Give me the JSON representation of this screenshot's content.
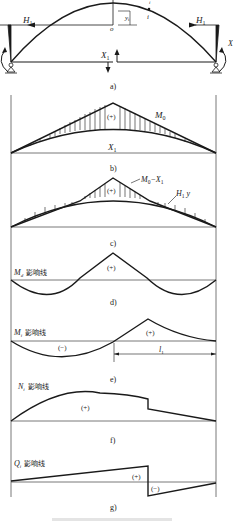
{
  "figure": {
    "panels": {
      "a": {
        "label": "a)",
        "left_force": "H",
        "left_force_sub": "1",
        "right_force": "H",
        "right_force_sub": "1",
        "redundant": "X",
        "redundant_sub": "1",
        "origin": "o",
        "section": "i",
        "section_top": "i",
        "ordinate": "y",
        "ordinate_sub": "i",
        "moment": "X"
      },
      "b": {
        "label": "b)",
        "curve_label": "M",
        "curve_label_sub": "0",
        "arch_label": "X",
        "arch_label_sub": "1",
        "sign": "(+)"
      },
      "c": {
        "label": "c)",
        "diff_label": "M",
        "diff_label_sub": "0",
        "diff_label_rest": "−X",
        "diff_label_rest_sub": "1",
        "arch_label": "H",
        "arch_label_sub": "1",
        "arch_label_var": "y",
        "sign": "(+)"
      },
      "d": {
        "label": "d)",
        "title": "M",
        "title_sub": "d",
        "title_cn": "影响线",
        "sign": "(+)"
      },
      "e": {
        "label": "e)",
        "title": "M",
        "title_sub": "i",
        "title_cn": "影响线",
        "sign_pos": "(+)",
        "sign_neg": "(−)",
        "dimension": "l",
        "dimension_sub": "1"
      },
      "f": {
        "label": "f)",
        "title": "N",
        "title_sub": "i",
        "title_cn": "影响线",
        "sign": "(+)"
      },
      "g": {
        "label": "g)",
        "title": "Q",
        "title_sub": "i",
        "title_cn": "影响线",
        "sign_pos": "(+)",
        "sign_neg": "(−)"
      }
    },
    "colors": {
      "line": "#1a1a1a",
      "frame": "#555555",
      "caption": "#d8d8d8"
    }
  }
}
